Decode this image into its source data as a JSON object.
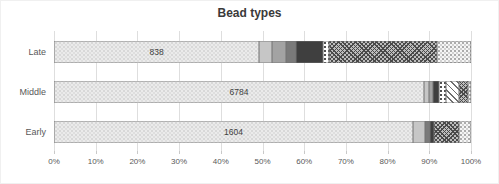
{
  "chart_data": {
    "type": "bar",
    "variant": "100-percent-stacked-horizontal",
    "title": "Bead types",
    "categories": [
      "Late",
      "Middle",
      "Early"
    ],
    "bar_value_labels": [
      "838",
      "6784",
      "1604"
    ],
    "x_ticks": [
      "0%",
      "10%",
      "20%",
      "30%",
      "40%",
      "50%",
      "60%",
      "70%",
      "80%",
      "90%",
      "100%"
    ],
    "xlim": [
      0,
      100
    ],
    "grid": true,
    "legend": false,
    "xlabel": "",
    "ylabel": "",
    "series": [
      {
        "name": "segment-light-speckle",
        "pattern": "speckle-light",
        "color": "#ebebeb",
        "values": [
          49.2,
          88.7,
          86.1
        ]
      },
      {
        "name": "segment-light-gray",
        "pattern": "solid",
        "color": "#c6c6c6",
        "values": [
          3.1,
          1.2,
          2.9
        ]
      },
      {
        "name": "segment-medium-gray",
        "pattern": "solid",
        "color": "#a3a3a3",
        "values": [
          3.4,
          1.0,
          0
        ]
      },
      {
        "name": "segment-dark-gray",
        "pattern": "solid",
        "color": "#7a7a7a",
        "values": [
          2.4,
          0,
          1.2
        ]
      },
      {
        "name": "segment-black",
        "pattern": "solid",
        "color": "#3f3f3f",
        "values": [
          6.5,
          1.4,
          1.0
        ]
      },
      {
        "name": "segment-white-dots",
        "pattern": "white-dots",
        "color": "#ffffff",
        "values": [
          1.4,
          1.7,
          0
        ]
      },
      {
        "name": "segment-diagonal-hatch",
        "pattern": "diagonal-hatch",
        "color": "#ffffff",
        "values": [
          0,
          3.1,
          0
        ]
      },
      {
        "name": "segment-dark-crosshatch",
        "pattern": "crosshatch-dark",
        "color": "#bdbdbd",
        "values": [
          25.9,
          2.2,
          6.0
        ]
      },
      {
        "name": "segment-end-speckle",
        "pattern": "speckle-end",
        "color": "#f6f6f6",
        "values": [
          8.1,
          0.7,
          2.8
        ]
      }
    ]
  },
  "style": {
    "title_color": "#3a3a3a",
    "gridline_color": "#dedede",
    "axis_text_color": "#595959",
    "segment_border_color": "#737373"
  },
  "layout_hints": {
    "bar_row_tops_px": [
      10,
      50,
      90
    ],
    "bar_height_px": 22
  }
}
